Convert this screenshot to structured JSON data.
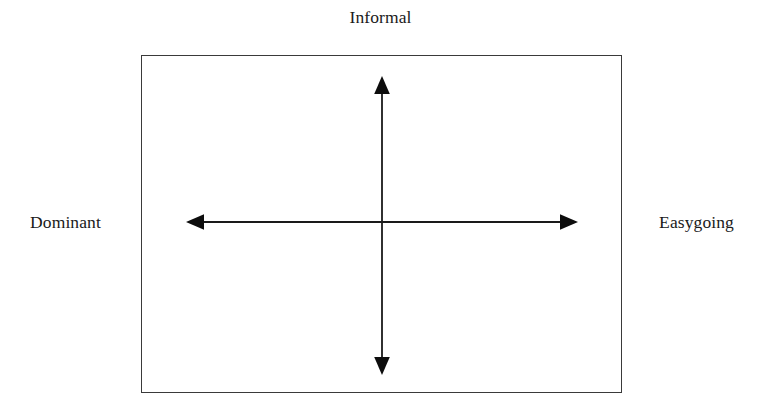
{
  "diagram": {
    "type": "two-axis-quadrant-matrix",
    "background_color": "#ffffff",
    "frame": {
      "border_color": "#3a3a3a",
      "fill_color": "#ffffff"
    },
    "axis_color": "#1a1a1a",
    "labels": {
      "top": "Informal",
      "left": "Dominant",
      "right": "Easygoing",
      "bottom": ""
    },
    "axes": [
      {
        "name": "horizontal-axis",
        "orientation": "horizontal",
        "double_headed": true,
        "start_label": "Dominant",
        "end_label": "Easygoing"
      },
      {
        "name": "vertical-axis",
        "orientation": "vertical",
        "double_headed": true,
        "start_label": "Informal",
        "end_label": ""
      }
    ]
  }
}
